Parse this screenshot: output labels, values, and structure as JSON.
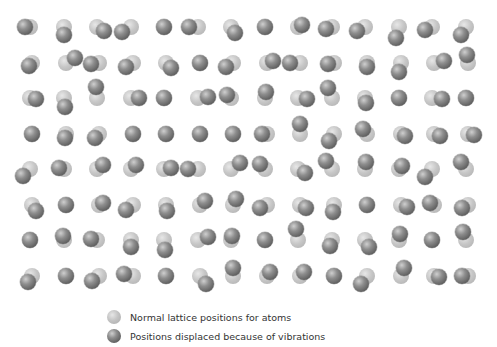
{
  "figure": {
    "grid": {
      "columns": 14,
      "rows": 8
    },
    "colors": {
      "normal": "#c4c4c4",
      "displaced": "#6a6a6a",
      "background": "#ffffff"
    }
  },
  "legend": {
    "items": [
      {
        "key": "normal",
        "label": "Normal lattice positions for atoms"
      },
      {
        "key": "displaced",
        "label": "Positions displaced because of vibrations"
      }
    ]
  }
}
